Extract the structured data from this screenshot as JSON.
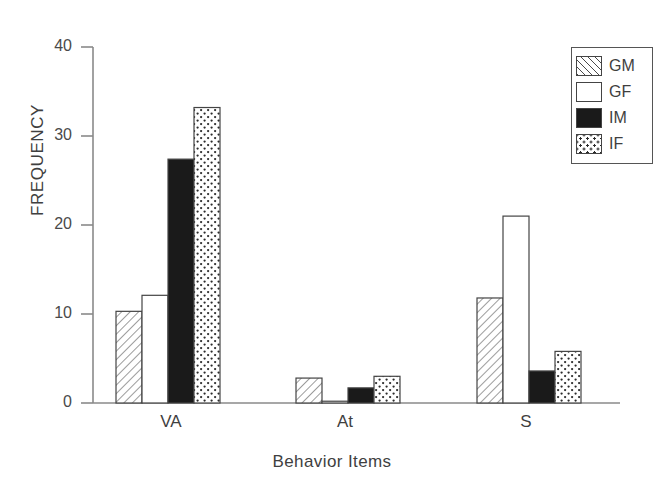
{
  "chart_data": {
    "type": "bar",
    "title": "",
    "xlabel": "Behavior Items",
    "ylabel": "FREQUENCY",
    "categories": [
      "VA",
      "At",
      "S"
    ],
    "ylim": [
      0,
      40
    ],
    "yticks": [
      0,
      10,
      20,
      30,
      40
    ],
    "grid": false,
    "legend_position": "top-right",
    "series": [
      {
        "name": "GM",
        "pattern": "diagonal-hatch",
        "values": [
          10.3,
          2.8,
          11.8
        ]
      },
      {
        "name": "GF",
        "pattern": "white",
        "values": [
          12.1,
          0.2,
          21.0
        ]
      },
      {
        "name": "IM",
        "pattern": "solid-black",
        "values": [
          27.4,
          1.7,
          3.6
        ]
      },
      {
        "name": "IF",
        "pattern": "dotted",
        "values": [
          33.2,
          3.0,
          5.8
        ]
      }
    ]
  },
  "legend": {
    "items": [
      {
        "label": "GM",
        "swatch": "fill-gm"
      },
      {
        "label": "GF",
        "swatch": "fill-gf"
      },
      {
        "label": "IM",
        "swatch": "fill-im"
      },
      {
        "label": "IF",
        "swatch": "fill-if"
      }
    ]
  },
  "axes": {
    "y_tick_labels": [
      "0",
      "10",
      "20",
      "30",
      "40"
    ],
    "x_tick_labels": [
      "VA",
      "At",
      "S"
    ],
    "y_axis_title": "FREQUENCY",
    "x_axis_title": "Behavior Items"
  },
  "colors": {
    "axis": "#8a8a8a",
    "bar_outline": "#444444",
    "text": "#3f3f3f",
    "black_bar": "#1a1a1a"
  }
}
